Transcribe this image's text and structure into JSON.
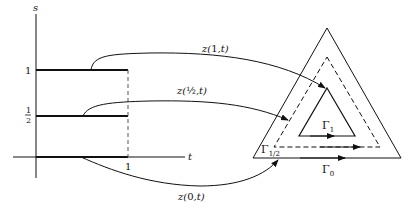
{
  "figure": {
    "left_plot": {
      "y_axis_label": "s",
      "x_axis_label": "t",
      "y_ticks": [
        "1",
        "1/2"
      ],
      "y_tick_half_num": "1",
      "y_tick_half_den": "2",
      "x_ticks": [
        "1"
      ]
    },
    "mappings": [
      {
        "label_prefix": "z(",
        "label_arg": "1",
        "label_suffix": ",t)"
      },
      {
        "label_prefix": "z(",
        "label_arg": "½",
        "label_suffix": ",t)"
      },
      {
        "label_prefix": "z(",
        "label_arg": "0",
        "label_suffix": ",t)"
      }
    ],
    "contours": {
      "inner": {
        "label": "Γ",
        "sub": "1"
      },
      "middle": {
        "label": "Γ",
        "sub": "1/2"
      },
      "outer": {
        "label": "Γ",
        "sub": "0"
      }
    },
    "colors": {
      "ink": "#111111",
      "background": "#ffffff"
    }
  }
}
